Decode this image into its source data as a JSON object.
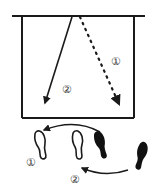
{
  "diagram": {
    "type": "movement-footwork-diagram",
    "court": {
      "stroke": "#1a1a1a"
    },
    "paths": [
      {
        "id": "path-1",
        "label": "①",
        "style": "dotted",
        "description": "dotted diagonal from top to bottom-right"
      },
      {
        "id": "path-2",
        "label": "②",
        "style": "solid",
        "description": "solid diagonal from top to bottom-left"
      }
    ],
    "footwork": {
      "label_1": "①",
      "label_2": "②",
      "outline_footprints": 2,
      "filled_footprints": 2
    }
  }
}
